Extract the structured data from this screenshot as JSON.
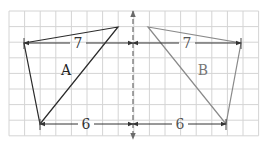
{
  "diagram": {
    "grid": {
      "x0": 9,
      "y0": 11,
      "cell": 15.6,
      "cols": 16,
      "rows": 8,
      "color": "#d4d4d4"
    },
    "axis": {
      "x": 133,
      "y_top": 11,
      "y_bottom": 139,
      "color": "#6a6a6a",
      "style": "dashed"
    },
    "shapes": [
      {
        "name": "A",
        "points": [
          [
            24,
            43
          ],
          [
            118,
            27
          ],
          [
            40,
            124
          ]
        ],
        "color": "#2b2b2b",
        "label": "A",
        "label_pos": [
          66,
          75
        ]
      },
      {
        "name": "B",
        "points": [
          [
            148,
            27
          ],
          [
            241,
            43
          ],
          [
            226,
            124
          ]
        ],
        "color": "#8a8a8a",
        "label": "B",
        "label_pos": [
          203,
          75
        ]
      }
    ],
    "dimensions": [
      {
        "side": "left",
        "label": "7",
        "x1": 24,
        "x2": 133,
        "y": 43,
        "label_x": 78,
        "color": "#333333",
        "label_color": "#333333"
      },
      {
        "side": "left",
        "label": "6",
        "x1": 40,
        "x2": 133,
        "y": 124,
        "label_x": 86,
        "color": "#333333",
        "label_color": "#333333"
      },
      {
        "side": "right",
        "label": "7",
        "x1": 133,
        "x2": 241,
        "y": 43,
        "label_x": 187,
        "color": "#333333",
        "label_color": "#555555"
      },
      {
        "side": "right",
        "label": "6",
        "x1": 133,
        "x2": 226,
        "y": 124,
        "label_x": 180,
        "color": "#333333",
        "label_color": "#555555"
      }
    ],
    "labels": {
      "shape_a": "A",
      "shape_b": "B",
      "top_left_length": "7",
      "bottom_left_length": "6",
      "top_right_length": "7",
      "bottom_right_length": "6"
    }
  }
}
